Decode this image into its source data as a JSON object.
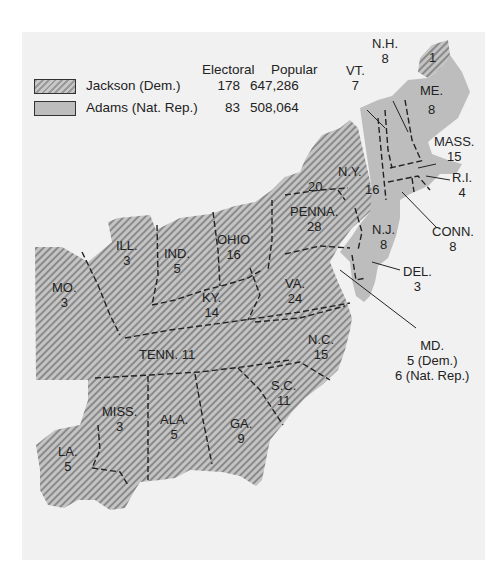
{
  "legend": {
    "headers": {
      "electoral": "Electoral",
      "popular": "Popular"
    },
    "rows": [
      {
        "candidate": "Jackson (Dem.)",
        "electoral": "178",
        "popular": "647,286",
        "pattern": "hatched"
      },
      {
        "candidate": "Adams (Nat. Rep.)",
        "electoral": "83",
        "popular": "508,064",
        "pattern": "solid"
      }
    ]
  },
  "colors": {
    "panel": "#f1f1f1",
    "adams_fill": "#bdbdbd",
    "jackson_fill": "#c4c4c4",
    "jackson_hatch": "#8a8a8a",
    "border": "#222222"
  },
  "states": [
    {
      "id": "me",
      "name": "ME.",
      "votes": "8",
      "winner": "Adams"
    },
    {
      "id": "me-district",
      "name": "",
      "votes": "1",
      "winner": "Jackson"
    },
    {
      "id": "nh",
      "name": "N.H.",
      "votes": "8",
      "winner": "Adams"
    },
    {
      "id": "vt",
      "name": "VT.",
      "votes": "7",
      "winner": "Adams"
    },
    {
      "id": "mass",
      "name": "MASS.",
      "votes": "15",
      "winner": "Adams"
    },
    {
      "id": "ri",
      "name": "R.I.",
      "votes": "4",
      "winner": "Adams"
    },
    {
      "id": "conn",
      "name": "CONN.",
      "votes": "8",
      "winner": "Adams"
    },
    {
      "id": "ny-jackson",
      "name": "N.Y.",
      "votes": "20",
      "winner": "Jackson"
    },
    {
      "id": "ny-adams",
      "name": "",
      "votes": "16",
      "winner": "Adams"
    },
    {
      "id": "nj",
      "name": "N.J.",
      "votes": "8",
      "winner": "Adams"
    },
    {
      "id": "del",
      "name": "DEL.",
      "votes": "3",
      "winner": "Adams"
    },
    {
      "id": "md",
      "name": "MD.",
      "votes": "5 (Dem.)",
      "votes2": "6 (Nat. Rep.)",
      "winner": "Split"
    },
    {
      "id": "penna",
      "name": "PENNA.",
      "votes": "28",
      "winner": "Jackson"
    },
    {
      "id": "ohio",
      "name": "OHIO",
      "votes": "16",
      "winner": "Jackson"
    },
    {
      "id": "ind",
      "name": "IND.",
      "votes": "5",
      "winner": "Jackson"
    },
    {
      "id": "ill",
      "name": "ILL.",
      "votes": "3",
      "winner": "Jackson"
    },
    {
      "id": "mo",
      "name": "MO.",
      "votes": "3",
      "winner": "Jackson"
    },
    {
      "id": "ky",
      "name": "KY.",
      "votes": "14",
      "winner": "Jackson"
    },
    {
      "id": "va",
      "name": "VA.",
      "votes": "24",
      "winner": "Jackson"
    },
    {
      "id": "nc",
      "name": "N.C.",
      "votes": "15",
      "winner": "Jackson"
    },
    {
      "id": "tenn",
      "name": "TENN.",
      "votes": "11",
      "winner": "Jackson"
    },
    {
      "id": "sc",
      "name": "S.C.",
      "votes": "11",
      "winner": "Jackson"
    },
    {
      "id": "ga",
      "name": "GA.",
      "votes": "9",
      "winner": "Jackson"
    },
    {
      "id": "ala",
      "name": "ALA.",
      "votes": "5",
      "winner": "Jackson"
    },
    {
      "id": "miss",
      "name": "MISS.",
      "votes": "3",
      "winner": "Jackson"
    },
    {
      "id": "la",
      "name": "LA.",
      "votes": "5",
      "winner": "Jackson"
    }
  ]
}
